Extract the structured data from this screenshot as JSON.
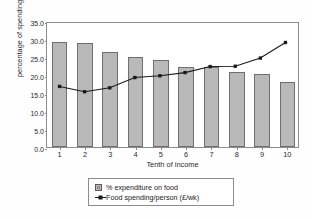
{
  "chart_data": {
    "type": "bar",
    "title": "",
    "xlabel": "Tenth of income",
    "ylabel": "percentage of spending on food",
    "categories": [
      "1",
      "2",
      "3",
      "4",
      "5",
      "6",
      "7",
      "8",
      "9",
      "10"
    ],
    "ylim": [
      0.0,
      35.0
    ],
    "ytick_labels": [
      "0.0",
      "5.0",
      "10.0",
      "15.0",
      "20.0",
      "25.0",
      "30.0",
      "35.0"
    ],
    "ytick_values": [
      0.0,
      5.0,
      10.0,
      15.0,
      20.0,
      25.0,
      30.0,
      35.0
    ],
    "grid": false,
    "legend_position": "bottom-center",
    "series": [
      {
        "name": "% expenditure on food",
        "kind": "bar",
        "color": "#b9b9b9",
        "values": [
          29.3,
          29.0,
          26.3,
          25.1,
          24.1,
          22.2,
          22.3,
          20.7,
          20.4,
          18.1
        ]
      },
      {
        "name": "Food spending/person (£/wk)",
        "kind": "line",
        "color": "#1a1a1a",
        "values": [
          17.1,
          15.6,
          16.7,
          19.6,
          20.1,
          21.0,
          22.7,
          22.8,
          25.1,
          29.5
        ]
      }
    ]
  },
  "legend": {
    "items": [
      {
        "label": "% expenditure on food",
        "marker": "bar-swatch-icon"
      },
      {
        "label": "Food spending/person (£/wk)",
        "marker": "line-marker-icon"
      }
    ]
  },
  "axes": {
    "y_title": "percentage of spending on food",
    "x_title": "Tenth of income"
  }
}
